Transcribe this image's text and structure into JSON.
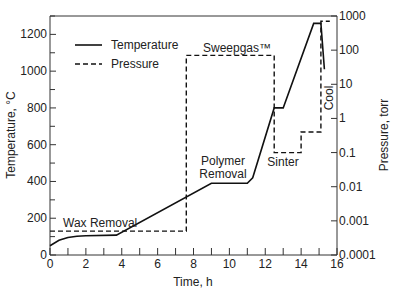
{
  "chart_data": {
    "type": "line",
    "title": "",
    "xlabel": "Time, h",
    "ylabel": "Temperature, °C",
    "ylabel_right": "Pressure, torr",
    "xlim": [
      0,
      16
    ],
    "ylim": [
      0,
      1300
    ],
    "ylim_right": [
      0.0001,
      1000
    ],
    "right_axis_scale": "log",
    "x_ticks": [
      "0",
      "2",
      "4",
      "6",
      "8",
      "10",
      "12",
      "14",
      "16"
    ],
    "y_ticks": [
      "0",
      "200",
      "400",
      "600",
      "800",
      "1000",
      "1200"
    ],
    "y_right_ticks": [
      "0.0001",
      "0.001",
      "0.01",
      "0.1",
      "1",
      "10",
      "100",
      "1000"
    ],
    "grid": false,
    "legend_position": "upper-left",
    "legend": [
      {
        "label": "Temperature",
        "style": "solid"
      },
      {
        "label": "Pressure",
        "style": "dashed"
      }
    ],
    "series": [
      {
        "name": "Temperature",
        "axis": "left",
        "style": "solid",
        "x": [
          0,
          0.5,
          1,
          1.5,
          2,
          3.7,
          9,
          11,
          11.3,
          12.5,
          13,
          14.7,
          15.1,
          15.3
        ],
        "values": [
          50,
          80,
          95,
          102,
          105,
          108,
          390,
          390,
          420,
          800,
          800,
          1260,
          1260,
          1010
        ]
      },
      {
        "name": "Pressure",
        "axis": "right",
        "style": "dashed",
        "x": [
          0,
          7.6,
          7.6,
          12.5,
          12.5,
          14,
          14,
          15.1,
          15.1,
          15.6
        ],
        "values": [
          0.0005,
          0.0005,
          70,
          70,
          0.1,
          0.1,
          0.4,
          0.4,
          700,
          700
        ]
      }
    ],
    "annotations": [
      {
        "text": "Wax Removal",
        "x": 1.5,
        "y": 150
      },
      {
        "text": "Sweepgas™",
        "x": 10,
        "y": 1100
      },
      {
        "text": "Polymer",
        "x": 10,
        "y": 430
      },
      {
        "text": "Removal",
        "x": 10,
        "y": 390
      },
      {
        "text": "Sinter",
        "x": 13.5,
        "y": 560
      },
      {
        "text": "Cool",
        "x": 15.8,
        "y": 700,
        "rotation": -90
      }
    ]
  }
}
